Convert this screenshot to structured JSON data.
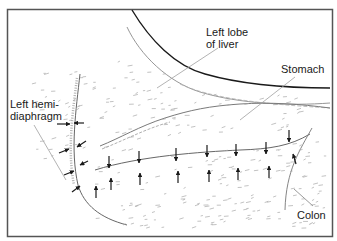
{
  "figure": {
    "labels": {
      "liver": "Left lobe\nof liver",
      "stomach": "Stomach",
      "diaphragm": "Left hemi-\ndiaphragm",
      "colon": "Colon"
    },
    "colors": {
      "ink": "#1a1a1a",
      "faint": "#9a9a9a",
      "frame": "#555555",
      "background": "#ffffff"
    },
    "arrows": {
      "diaphragm_inward_pairs": 1,
      "diaphragm_pointing": 6,
      "stomach_down": 7,
      "stomach_up": 7
    }
  }
}
